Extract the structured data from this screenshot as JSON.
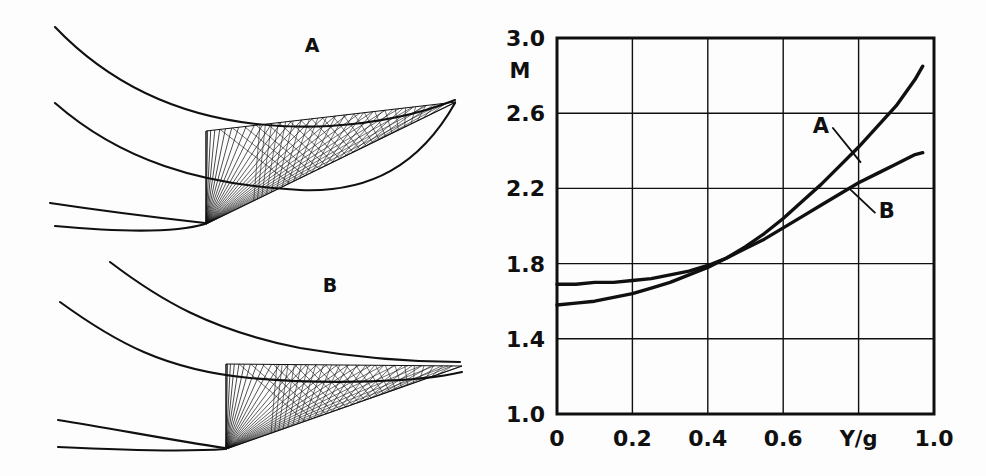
{
  "figure": {
    "background_color": "#fdfdfd",
    "ink_color": "#101010",
    "panels": [
      {
        "id": "geometry-panel",
        "label": "A",
        "description": "supersonic-nozzle-characteristics-mesh-A"
      },
      {
        "id": "geometry-panel",
        "label": "B",
        "description": "supersonic-nozzle-characteristics-mesh-B"
      }
    ]
  },
  "geometry": {
    "panel_a": {
      "letter": "A",
      "letter_x": 312,
      "letter_y": 45,
      "upper_wall": "M 55,27 C 120,95 210,132 330,126 C 390,122 430,110 455,100",
      "mid_wall": "M 55,103 C 120,160 200,185 300,190 C 370,193 420,165 455,103",
      "lower_wall": "M 50,203 C 110,212 160,218 205,223",
      "lower_wall2": "M 55,226 C 120,232 175,233 205,224",
      "throat_x": 206,
      "throat_top_y": 131,
      "corner_x": 206,
      "corner_y": 224,
      "tip_x": 456,
      "tip_y": 102,
      "fan_rays": 26,
      "mesh_lines": 22
    },
    "panel_b": {
      "letter": "B",
      "letter_x": 330,
      "letter_y": 285,
      "upper_wall": "M 110,262 C 160,300 210,330 300,348 C 370,360 430,362 460,362",
      "mid_wall": "M 60,302 C 115,342 165,370 250,378 C 330,385 420,382 462,372",
      "lower_wall": "M 58,420 C 110,428 170,440 225,448",
      "lower_wall2": "M 58,447 C 120,450 185,452 225,449",
      "throat_x": 226,
      "throat_top_y": 364,
      "corner_x": 226,
      "corner_y": 449,
      "tip_x": 462,
      "tip_y": 366,
      "fan_rays": 26,
      "mesh_lines": 22
    }
  },
  "chart_data": {
    "type": "line",
    "title": "",
    "xlabel": "Y/g",
    "ylabel": "M",
    "xlim": [
      0,
      1.0
    ],
    "ylim": [
      1.0,
      3.0
    ],
    "grid": true,
    "x_ticks": [
      0,
      0.2,
      0.4,
      0.6,
      0.8,
      1.0
    ],
    "x_tick_labels": [
      "0",
      "0.2",
      "0.4",
      "0.6",
      "Y/g",
      "1.0"
    ],
    "y_ticks": [
      1.0,
      1.4,
      1.8,
      2.2,
      2.6,
      3.0
    ],
    "y_tick_labels": [
      "1.0",
      "1.4",
      "1.8",
      "2.2",
      "2.6",
      "3.0"
    ],
    "legend_position": "inline-annotation",
    "series": [
      {
        "name": "A",
        "label_x": 0.72,
        "label_y": 2.48,
        "x": [
          0.0,
          0.05,
          0.1,
          0.15,
          0.2,
          0.25,
          0.3,
          0.35,
          0.4,
          0.45,
          0.5,
          0.55,
          0.6,
          0.65,
          0.7,
          0.75,
          0.8,
          0.85,
          0.9,
          0.95,
          0.97
        ],
        "y": [
          1.69,
          1.69,
          1.7,
          1.7,
          1.71,
          1.72,
          1.74,
          1.76,
          1.79,
          1.83,
          1.89,
          1.96,
          2.04,
          2.13,
          2.22,
          2.32,
          2.42,
          2.53,
          2.64,
          2.78,
          2.85
        ]
      },
      {
        "name": "B",
        "label_x": 0.86,
        "label_y": 2.08,
        "x": [
          0.0,
          0.05,
          0.1,
          0.15,
          0.2,
          0.25,
          0.3,
          0.35,
          0.4,
          0.45,
          0.5,
          0.55,
          0.6,
          0.65,
          0.7,
          0.75,
          0.8,
          0.85,
          0.9,
          0.95,
          0.97
        ],
        "y": [
          1.58,
          1.59,
          1.6,
          1.62,
          1.64,
          1.67,
          1.7,
          1.74,
          1.78,
          1.83,
          1.88,
          1.93,
          1.99,
          2.05,
          2.11,
          2.17,
          2.23,
          2.28,
          2.33,
          2.38,
          2.39
        ]
      }
    ],
    "annotations": [
      {
        "text": "A",
        "x": 0.7,
        "y": 2.5,
        "leader_to_x": 0.805,
        "leader_to_y": 2.34
      },
      {
        "text": "B",
        "x": 0.875,
        "y": 2.05,
        "leader_to_x": 0.775,
        "leader_to_y": 2.2
      }
    ]
  },
  "plot_geometry": {
    "left": 77,
    "right": 454,
    "top": 38,
    "bottom": 414,
    "frame_width": 3,
    "grid_width": 1.4
  }
}
